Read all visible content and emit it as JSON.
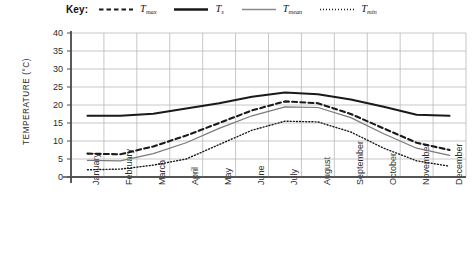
{
  "legend": {
    "title": "Key:",
    "items": [
      {
        "label": "T",
        "sub": "max",
        "style": "dashed",
        "name": "legend-tmax"
      },
      {
        "label": "T",
        "sub": "s",
        "style": "thick-solid",
        "name": "legend-ts"
      },
      {
        "label": "T",
        "sub": "mean",
        "style": "thin-solid",
        "name": "legend-tmean"
      },
      {
        "label": "T",
        "sub": "min",
        "style": "dotted",
        "name": "legend-tmin"
      }
    ]
  },
  "chart_data": {
    "type": "line",
    "title": "",
    "xlabel": "",
    "ylabel": "TEMPERATURE (°C)",
    "ylim": [
      0,
      40
    ],
    "yticks": [
      0,
      5,
      10,
      15,
      20,
      25,
      30,
      35,
      40
    ],
    "grid": true,
    "legend_position": "top",
    "categories": [
      "January",
      "February",
      "March",
      "April",
      "May",
      "June",
      "July",
      "August",
      "September",
      "October",
      "November",
      "December"
    ],
    "series": [
      {
        "name": "T_max",
        "label": "Tmax",
        "style": "dashed",
        "color": "#1a1a1a",
        "width": 2.1,
        "values": [
          6.5,
          6.3,
          8.5,
          11.5,
          15.0,
          18.5,
          21.0,
          20.5,
          17.5,
          13.5,
          9.5,
          7.5
        ]
      },
      {
        "name": "T_s",
        "label": "Ts",
        "style": "thick-solid",
        "color": "#1a1a1a",
        "width": 2.0,
        "values": [
          17.0,
          17.0,
          17.6,
          19.0,
          20.5,
          22.3,
          23.5,
          23.0,
          21.5,
          19.5,
          17.3,
          17.0
        ]
      },
      {
        "name": "T_mean",
        "label": "Tmean",
        "style": "thin-solid",
        "color": "#7a7a7a",
        "width": 1.2,
        "values": [
          4.6,
          4.5,
          6.5,
          9.5,
          13.5,
          17.0,
          19.5,
          19.3,
          16.5,
          12.0,
          8.0,
          6.0
        ]
      },
      {
        "name": "T_min",
        "label": "Tmin",
        "style": "dotted",
        "color": "#1a1a1a",
        "width": 1.4,
        "values": [
          2.0,
          2.2,
          3.3,
          5.0,
          9.0,
          13.0,
          15.5,
          15.3,
          12.5,
          8.0,
          4.5,
          3.0
        ]
      }
    ]
  },
  "geometry": {
    "plot_left": 71,
    "plot_right": 466,
    "plot_top": 33,
    "plot_bottom": 177
  }
}
